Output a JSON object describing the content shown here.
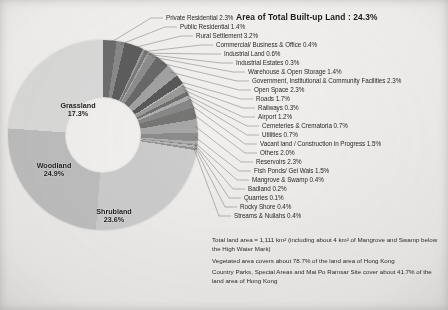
{
  "title": "Area of Total Built-up Land : 24.3%",
  "chart_data": {
    "type": "pie",
    "title": "Area of Total Built-up Land : 24.3%",
    "subtype": "donut",
    "units": "percent of total land area",
    "legend_position": "callout-labels-right",
    "grid": false,
    "inner_radius_ratio": 0.4,
    "categories": [
      "Private Residential",
      "Public Residential",
      "Rural Settlement",
      "Commercial/ Business & Office",
      "Industrial Land",
      "Industrial Estates",
      "Warehouse & Open Storage",
      "Government, Institutional & Community Facilities",
      "Open Space",
      "Roads",
      "Railways",
      "Airport",
      "Cemeteries & Crematoria",
      "Utilities",
      "Vacant land / Construction in Progress",
      "Others",
      "Reservoirs",
      "Fish Ponds/ Gei Wais",
      "Mangrove & Swamp",
      "Badland",
      "Quarries",
      "Rocky Shore",
      "Streams & Nullahs",
      "Shrubland",
      "Woodland",
      "Grassland"
    ],
    "values": [
      2.3,
      1.4,
      3.2,
      0.4,
      0.6,
      0.3,
      1.4,
      2.3,
      2.3,
      1.7,
      0.3,
      1.2,
      0.7,
      0.7,
      1.5,
      2.0,
      2.3,
      1.5,
      0.4,
      0.2,
      0.1,
      0.4,
      0.4,
      23.6,
      24.9,
      17.3
    ],
    "labels": [
      "Private Residential 2.3%",
      "Public Residential 1.4%",
      "Rural Settlement 3.2%",
      "Commercial/ Business & Office 0.4%",
      "Industrial Land 0.6%",
      "Industrial Estates 0.3%",
      "Warehouse & Open Storage 1.4%",
      "Government, Institutional & Community Facilities 2.3%",
      "Open Space 2.3%",
      "Roads 1.7%",
      "Railways 0.3%",
      "Airport 1.2%",
      "Cemeteries & Crematoria 0.7%",
      "Utilities 0.7%",
      "Vacant land / Construction in Progress 1.5%",
      "Others 2.0%",
      "Reservoirs 2.3%",
      "Fish Ponds/ Gei Wais 1.5%",
      "Mangrove & Swamp 0.4%",
      "Badland 0.2%",
      "Quarries 0.1%",
      "Rocky Shore 0.4%",
      "Streams & Nullahs 0.4%",
      "Shrubland 23.6%",
      "Woodland 24.9%",
      "Grassland 17.3%"
    ],
    "annotations": [
      "Area of Total Built-up Land : 24.3%",
      "Total land area = 1,111 km² (including about 4 km² of Mangrove and Swamp below the High Water Mark)",
      "Vegetated area covers about 78.7% of the land area of Hong Kong",
      "Country Parks, Special Areas and Mai Po Ramsar Site cover about 41.7% of the land area of Hong Kong"
    ]
  },
  "wedge_labels": {
    "grassland": {
      "name": "Grassland",
      "value": "17.3%"
    },
    "woodland": {
      "name": "Woodland",
      "value": "24.9%"
    },
    "shrubland": {
      "name": "Shrubland",
      "value": "23.6%"
    }
  },
  "callouts": [
    "Private Residential 2.3%",
    "Public Residential 1.4%",
    "Rural Settlement 3.2%",
    "Commercial/ Business & Office 0.4%",
    "Industrial Land 0.6%",
    "Industrial Estates 0.3%",
    "Warehouse & Open Storage 1.4%",
    "Government, Institutional & Community Facilities 2.3%",
    "Open Space 2.3%",
    "Roads 1.7%",
    "Railways 0.3%",
    "Airport 1.2%",
    "Cemeteries & Crematoria 0.7%",
    "Utilities 0.7%",
    "Vacant land / Construction in Progress 1.5%",
    "Others 2.0%",
    "Reservoirs 2.3%",
    "Fish Ponds/ Gei Wais 1.5%",
    "Mangrove & Swamp 0.4%",
    "Badland 0.2%",
    "Quarries 0.1%",
    "Rocky Shore 0.4%",
    "Streams & Nullahs 0.4%"
  ],
  "notes": [
    "Total land area = 1,111 km² (including about 4 km² of Mangrove and Swamp below the High Water Mark)",
    "Vegetated area covers about 78.7% of the land area of Hong Kong",
    "Country Parks, Special Areas and Mai Po Ramsar Site cover about 41.7% of the land area of Hong Kong"
  ],
  "colors": {
    "background": "#f2f1ef",
    "text": "#2b2b2b",
    "grassland": "#d8d8d6",
    "woodland": "#bdbdbb",
    "shrubland": "#cacac8",
    "builtup_dark": "#6e6e6c",
    "builtup_mid": "#969694"
  }
}
